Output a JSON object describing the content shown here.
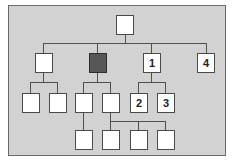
{
  "diagram": {
    "type": "org-chart-tree",
    "colors": {
      "background": "#d2d2d2",
      "node_fill": "#ffffff",
      "highlight_fill": "#575757",
      "line": "#4f4f4f"
    },
    "nodes": [
      {
        "id": "root",
        "label": "",
        "level": 0
      },
      {
        "id": "a",
        "label": "",
        "level": 1,
        "parent": "root"
      },
      {
        "id": "b",
        "label": "",
        "level": 1,
        "parent": "root",
        "highlighted": true
      },
      {
        "id": "n1",
        "label": "1",
        "level": 1,
        "parent": "root"
      },
      {
        "id": "n4",
        "label": "4",
        "level": 1,
        "parent": "root"
      },
      {
        "id": "a1",
        "label": "",
        "level": 2,
        "parent": "a"
      },
      {
        "id": "a2",
        "label": "",
        "level": 2,
        "parent": "a"
      },
      {
        "id": "b1",
        "label": "",
        "level": 2,
        "parent": "b"
      },
      {
        "id": "b2",
        "label": "",
        "level": 2,
        "parent": "b"
      },
      {
        "id": "n2",
        "label": "2",
        "level": 2,
        "parent": "n1"
      },
      {
        "id": "n3",
        "label": "3",
        "level": 2,
        "parent": "n1"
      },
      {
        "id": "b1a",
        "label": "",
        "level": 3,
        "parent": "b1"
      },
      {
        "id": "b2a",
        "label": "",
        "level": 3,
        "parent": "b2"
      },
      {
        "id": "b2b",
        "label": "",
        "level": 3,
        "parent": "b2"
      },
      {
        "id": "b2c",
        "label": "",
        "level": 3,
        "parent": "b2"
      }
    ]
  },
  "labels": {
    "n1": "1",
    "n2": "2",
    "n3": "3",
    "n4": "4"
  }
}
